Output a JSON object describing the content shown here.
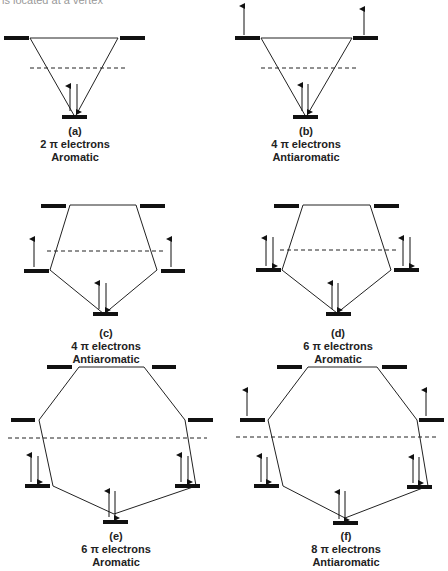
{
  "top_fragment": "is located at a vertex",
  "panels": [
    {
      "label": "(a)",
      "electrons": "2 π electrons",
      "type": "Aromatic"
    },
    {
      "label": "(b)",
      "electrons": "4 π electrons",
      "type": "Antiaromatic"
    },
    {
      "label": "(c)",
      "electrons": "4 π electrons",
      "type": "Antiaromatic"
    },
    {
      "label": "(d)",
      "electrons": "6 π electrons",
      "type": "Aromatic"
    },
    {
      "label": "(e)",
      "electrons": "6 π electrons",
      "type": "Aromatic"
    },
    {
      "label": "(f)",
      "electrons": "8 π electrons",
      "type": "Antiaromatic"
    }
  ],
  "colors": {
    "line": "#222222",
    "bar": "#111111"
  }
}
